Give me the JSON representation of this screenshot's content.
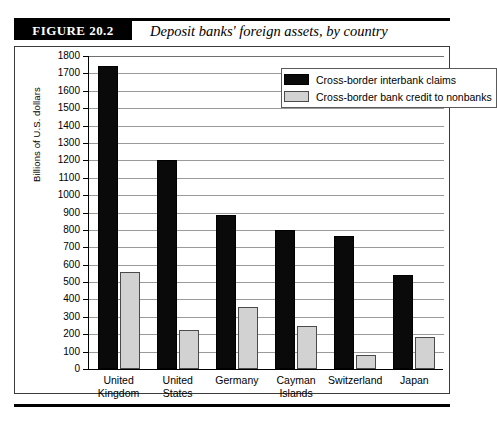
{
  "figure": {
    "badge_prefix": "FIGURE",
    "badge_number": "20.2",
    "title": "Deposit banks' foreign assets, by country"
  },
  "chart_data": {
    "type": "bar",
    "title": "Deposit banks' foreign assets, by country",
    "xlabel": "",
    "ylabel": "Billions of U.S. dollars",
    "ylim": [
      0,
      1800
    ],
    "ytick_step": 100,
    "grid": true,
    "legend_position": "top-right-inside",
    "categories": [
      "United Kingdom",
      "United States",
      "Germany",
      "Cayman Islands",
      "Switzerland",
      "Japan"
    ],
    "category_lines": [
      [
        "United",
        "Kingdom"
      ],
      [
        "United",
        "States"
      ],
      [
        "Germany",
        ""
      ],
      [
        "Cayman",
        "Islands"
      ],
      [
        "Switzerland",
        ""
      ],
      [
        "Japan",
        ""
      ]
    ],
    "series": [
      {
        "name": "Cross-border interbank claims",
        "color": "#0a0a0a",
        "values": [
          1745,
          1200,
          885,
          800,
          765,
          540
        ]
      },
      {
        "name": "Cross-border bank credit to nonbanks",
        "color": "#d2d2d2",
        "values": [
          560,
          225,
          355,
          245,
          80,
          185
        ]
      }
    ],
    "ytick_labels": [
      "1800",
      "1700",
      "1600",
      "1500",
      "1400",
      "1300",
      "1200",
      "1100",
      "1000",
      "900",
      "800",
      "700",
      "600",
      "500",
      "400",
      "300",
      "200",
      "100",
      "0"
    ]
  }
}
